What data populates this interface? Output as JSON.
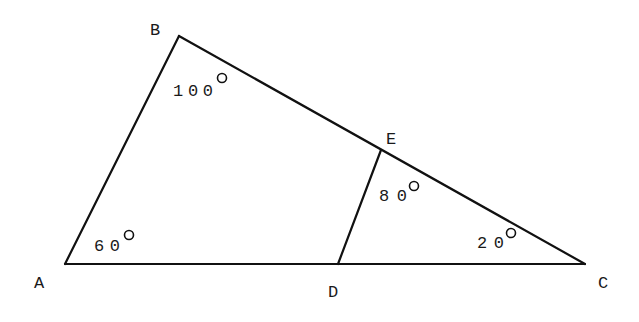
{
  "diagram": {
    "type": "geometry-triangle",
    "points": {
      "A": {
        "label": "A",
        "x": 65,
        "y": 264
      },
      "B": {
        "label": "B",
        "x": 179,
        "y": 36
      },
      "C": {
        "label": "C",
        "x": 585,
        "y": 264
      },
      "D": {
        "label": "D",
        "x": 338,
        "y": 264
      },
      "E": {
        "label": "E",
        "x": 381,
        "y": 150
      }
    },
    "segments": [
      "AB",
      "BC",
      "AC",
      "DE"
    ],
    "angles": {
      "A": {
        "value": "60",
        "unit": "°"
      },
      "B": {
        "value": "100",
        "unit": "°"
      },
      "E": {
        "value": "80",
        "unit": "°"
      },
      "C": {
        "value": "20",
        "unit": "°"
      }
    },
    "line_color": "#111111"
  }
}
